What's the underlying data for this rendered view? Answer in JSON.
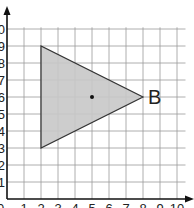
{
  "diagram": {
    "type": "coordinate-grid",
    "x_range": [
      0,
      10
    ],
    "y_range": [
      0,
      10
    ],
    "x_tick_labels": [
      "1",
      "2",
      "3",
      "4",
      "5",
      "6",
      "7",
      "8",
      "9",
      "10"
    ],
    "y_tick_labels": [
      "1",
      "2",
      "3",
      "4",
      "5",
      "6",
      "7",
      "8",
      "9",
      "10"
    ],
    "origin_label": "0",
    "shape": {
      "kind": "triangle",
      "vertices": [
        [
          2,
          9
        ],
        [
          2,
          3
        ],
        [
          8,
          6
        ]
      ],
      "fill": "#c8c8c8",
      "stroke": "#333333"
    },
    "center_point": [
      5,
      6
    ],
    "vertex_label": {
      "text": "B",
      "at": [
        8,
        6
      ]
    }
  }
}
